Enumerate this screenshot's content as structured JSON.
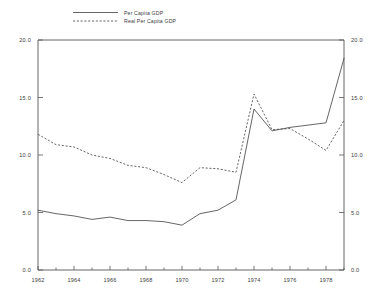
{
  "chart_data": {
    "type": "line",
    "title": "",
    "xlabel": "",
    "ylabel": "",
    "xlim": [
      1962,
      1979
    ],
    "ylim": [
      0.0,
      20.0
    ],
    "grid": false,
    "legend_position": "top-center",
    "y_ticks": [
      "0.0",
      "5.0",
      "10.0",
      "15.0",
      "20.0"
    ],
    "y_tick_values": [
      0.0,
      5.0,
      10.0,
      15.0,
      20.0
    ],
    "y_axis_right_ticks": [
      "0.0",
      "5.0",
      "10.0",
      "15.0",
      "20.0"
    ],
    "x_ticks": [
      "1962",
      "1964",
      "1966",
      "1968",
      "1970",
      "1972",
      "1974",
      "1976",
      "1978"
    ],
    "x_tick_values": [
      1962,
      1964,
      1966,
      1968,
      1970,
      1972,
      1974,
      1976,
      1978
    ],
    "x_minor_ticks": [
      1963,
      1965,
      1967,
      1969,
      1971,
      1973,
      1975,
      1977,
      1979
    ],
    "x": [
      1962,
      1963,
      1964,
      1965,
      1966,
      1967,
      1968,
      1969,
      1970,
      1971,
      1972,
      1973,
      1974,
      1975,
      1976,
      1977,
      1978,
      1979
    ],
    "series": [
      {
        "name": "Per Capita GDP",
        "style": "solid",
        "values": [
          5.2,
          4.9,
          4.7,
          4.4,
          4.6,
          4.3,
          4.3,
          4.2,
          3.9,
          4.9,
          5.2,
          6.1,
          14.0,
          12.1,
          12.4,
          12.6,
          12.8,
          18.4
        ]
      },
      {
        "name": "Real Per Capita GDP",
        "style": "dashed",
        "values": [
          11.8,
          10.9,
          10.7,
          10.0,
          9.7,
          9.1,
          8.9,
          8.3,
          7.6,
          8.9,
          8.8,
          8.5,
          15.3,
          12.2,
          12.3,
          11.4,
          10.4,
          13.0
        ]
      }
    ]
  },
  "legend": {
    "entries": [
      {
        "label": "Per Capita GDP"
      },
      {
        "label": "Real Per Capita GDP"
      }
    ]
  }
}
